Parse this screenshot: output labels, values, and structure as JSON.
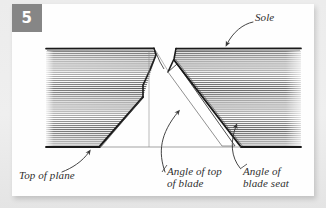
{
  "figure": {
    "step_number": "5",
    "badge_color": "#868686",
    "card_background": "#fefefe",
    "page_background": "#ececec",
    "ink_color": "#1a1a1a",
    "hatch_color": "#555555",
    "label_color": "#2f2f2f"
  },
  "labels": {
    "sole": "Sole",
    "top_of_plane": "Top of plane",
    "angle_of_top_of_blade": "Angle of top\nof blade",
    "angle_of_blade_seat": "Angle of\nblade seat"
  },
  "icons": {
    "leader_arrow_sole": "arrow-down-left-icon",
    "leader_arrow_top_of_plane": "arrow-up-right-icon",
    "leader_arrow_angle_of_top": "arrow-up-right-icon",
    "leader_arrow_angle_of_seat": "arrow-up-right-icon"
  }
}
